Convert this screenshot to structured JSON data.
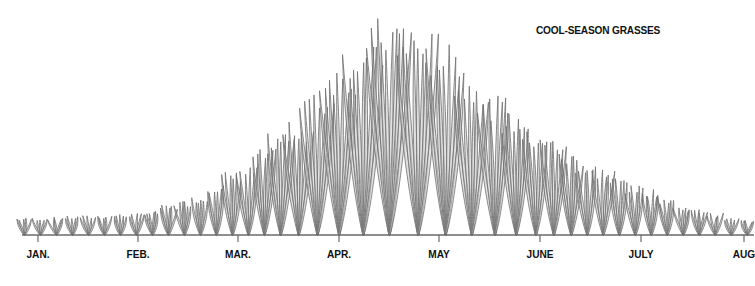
{
  "title": "COOL-SEASON GRASSES",
  "colors": {
    "blade_stroke": "#6e6e6e",
    "blade_fill": "#c8c8c8",
    "baseline": "#6a6a6a",
    "text": "#111111"
  },
  "chart_data": {
    "type": "area",
    "title": "COOL-SEASON GRASSES",
    "subtitle": "",
    "xlabel": "",
    "ylabel": "",
    "categories": [
      "JAN.",
      "FEB.",
      "MAR.",
      "APR.",
      "MAY",
      "JUNE",
      "JULY",
      "AUG"
    ],
    "series": [
      {
        "name": "Relative growth (illustrated as grass clump height)",
        "x": [
          "JAN.",
          "mid-JAN.",
          "FEB.",
          "mid-FEB.",
          "MAR.",
          "mid-MAR.",
          "APR.",
          "mid-APR.",
          "MAY",
          "mid-MAY",
          "JUNE",
          "mid-JUNE",
          "JULY",
          "mid-JULY",
          "AUG"
        ],
        "values": [
          8,
          9,
          10,
          16,
          30,
          50,
          78,
          100,
          88,
          64,
          47,
          32,
          22,
          12,
          7
        ]
      }
    ],
    "ylim": [
      0,
      100
    ],
    "grid": false,
    "legend": "none",
    "annotations": [
      "COOL-SEASON GRASSES"
    ]
  },
  "axis": {
    "months": [
      {
        "label": "JAN.",
        "x": 38
      },
      {
        "label": "FEB.",
        "x": 138
      },
      {
        "label": "MAR.",
        "x": 238
      },
      {
        "label": "APR.",
        "x": 339
      },
      {
        "label": "MAY",
        "x": 439
      },
      {
        "label": "JUNE",
        "x": 540
      },
      {
        "label": "JULY",
        "x": 641
      },
      {
        "label": "AUG",
        "x": 744
      }
    ]
  }
}
